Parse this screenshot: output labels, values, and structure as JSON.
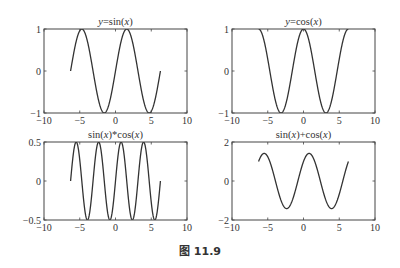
{
  "figure": {
    "caption": "图 11.9"
  },
  "chart_data": [
    {
      "type": "line",
      "title": "y=sin(x)",
      "title_parts": [
        {
          "t": "y",
          "i": true
        },
        {
          "t": "=sin(",
          "i": false
        },
        {
          "t": "x",
          "i": true
        },
        {
          "t": ")",
          "i": false
        }
      ],
      "function": "sin",
      "x_range": [
        -6.2832,
        6.2832
      ],
      "xlim": [
        -10,
        10
      ],
      "ylim": [
        -1,
        1
      ],
      "xticks": [
        -10,
        -5,
        0,
        5,
        10
      ],
      "yticks": [
        -1,
        0,
        1
      ],
      "ytick_labels": [
        "−1",
        "0",
        "1"
      ],
      "xtick_labels": [
        "−10",
        "−5",
        "0",
        "5",
        "10"
      ],
      "xlabel": "",
      "ylabel": "",
      "grid": false,
      "box": {
        "x": 44,
        "y": 29,
        "w": 143,
        "h": 84
      }
    },
    {
      "type": "line",
      "title": "y=cos(x)",
      "title_parts": [
        {
          "t": "y",
          "i": true
        },
        {
          "t": "=cos(",
          "i": false
        },
        {
          "t": "x",
          "i": true
        },
        {
          "t": ")",
          "i": false
        }
      ],
      "function": "cos",
      "x_range": [
        -6.2832,
        6.2832
      ],
      "xlim": [
        -10,
        10
      ],
      "ylim": [
        -1,
        1
      ],
      "xticks": [
        -10,
        -5,
        0,
        5,
        10
      ],
      "yticks": [
        -1,
        0,
        1
      ],
      "ytick_labels": [
        "−1",
        "0",
        "1"
      ],
      "xtick_labels": [
        "−10",
        "−5",
        "0",
        "5",
        "10"
      ],
      "xlabel": "",
      "ylabel": "",
      "grid": false,
      "box": {
        "x": 232,
        "y": 29,
        "w": 143,
        "h": 84
      }
    },
    {
      "type": "line",
      "title": "sin(x)*cos(x)",
      "title_parts": [
        {
          "t": "sin(",
          "i": false
        },
        {
          "t": "x",
          "i": true
        },
        {
          "t": ")*cos(",
          "i": false
        },
        {
          "t": "x",
          "i": true
        },
        {
          "t": ")",
          "i": false
        }
      ],
      "function": "sincos",
      "x_range": [
        -6.2832,
        6.2832
      ],
      "xlim": [
        -10,
        10
      ],
      "ylim": [
        -0.5,
        0.5
      ],
      "xticks": [
        -10,
        -5,
        0,
        5,
        10
      ],
      "yticks": [
        -0.5,
        0,
        0.5
      ],
      "ytick_labels": [
        "−0.5",
        "0",
        "0.5"
      ],
      "xtick_labels": [
        "−10",
        "−5",
        "0",
        "5",
        "10"
      ],
      "xlabel": "",
      "ylabel": "",
      "grid": false,
      "box": {
        "x": 44,
        "y": 142,
        "w": 143,
        "h": 78
      }
    },
    {
      "type": "line",
      "title": "sin(x)+cos(x)",
      "title_parts": [
        {
          "t": "sin(",
          "i": false
        },
        {
          "t": "x",
          "i": true
        },
        {
          "t": ")+cos(",
          "i": false
        },
        {
          "t": "x",
          "i": true
        },
        {
          "t": ")",
          "i": false
        }
      ],
      "function": "sinpluscos",
      "x_range": [
        -6.2832,
        6.2832
      ],
      "xlim": [
        -10,
        10
      ],
      "ylim": [
        -2,
        2
      ],
      "xticks": [
        -10,
        -5,
        0,
        5,
        10
      ],
      "yticks": [
        -2,
        0,
        2
      ],
      "ytick_labels": [
        "−2",
        "0",
        "2"
      ],
      "xtick_labels": [
        "−10",
        "−5",
        "0",
        "5",
        "10"
      ],
      "xlabel": "",
      "ylabel": "",
      "grid": false,
      "box": {
        "x": 232,
        "y": 142,
        "w": 143,
        "h": 78
      }
    }
  ]
}
